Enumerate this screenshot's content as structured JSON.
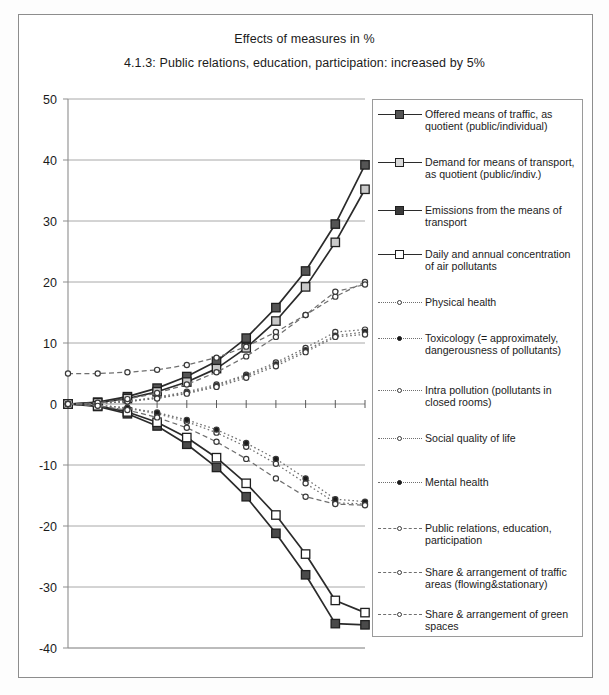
{
  "figure": {
    "title": "Effects of measures in %",
    "subtitle": "4.1.3: Public relations, education, participation: increased by 5%"
  },
  "chart_data": {
    "type": "line",
    "title": "Effects of measures in %",
    "subtitle": "4.1.3: Public relations, education, participation: increased by 5%",
    "xlabel": "",
    "ylabel": "",
    "ylim": [
      -40,
      50
    ],
    "ytick_labels": [
      "50",
      "40",
      "30",
      "20",
      "10",
      "0",
      "-10",
      "-20",
      "-30",
      "-40"
    ],
    "yticks": [
      50,
      40,
      30,
      20,
      10,
      0,
      -10,
      -20,
      -30,
      -40
    ],
    "grid": true,
    "legend_position": "right",
    "x": [
      0,
      1,
      2,
      3,
      4,
      5,
      6,
      7,
      8,
      9,
      10
    ],
    "xtick_labels": [
      "",
      "",
      "",
      "",
      "",
      "",
      "",
      "",
      "",
      "",
      ""
    ],
    "series": [
      {
        "name": "Offered means of traffic, as quotient (public/individual)",
        "style": "solid",
        "marker": "square-filled",
        "values": [
          0,
          0.3,
          1.2,
          2.6,
          4.5,
          7.0,
          10.8,
          15.8,
          21.8,
          29.5,
          39.2
        ]
      },
      {
        "name": "Demand for means of transport, as quotient (public/indiv.)",
        "style": "solid",
        "marker": "square-open",
        "values": [
          0,
          0.2,
          0.9,
          2.0,
          3.6,
          5.8,
          9.2,
          13.6,
          19.2,
          26.5,
          35.2
        ]
      },
      {
        "name": "Emissions from the means of transport",
        "style": "solid",
        "marker": "square-dark",
        "values": [
          0,
          -0.4,
          -1.6,
          -3.6,
          -6.6,
          -10.4,
          -15.2,
          -21.2,
          -28.0,
          -36.0,
          -36.2
        ]
      },
      {
        "name": "Daily and annual concentration of air pollutants",
        "style": "solid",
        "marker": "square-white",
        "values": [
          0,
          -0.3,
          -1.3,
          -3.0,
          -5.5,
          -8.8,
          -13.0,
          -18.2,
          -24.6,
          -32.2,
          -34.2
        ]
      },
      {
        "name": "Physical health",
        "style": "dotted",
        "marker": "circle-open",
        "values": [
          0,
          0.1,
          0.5,
          1.1,
          2.0,
          3.2,
          4.8,
          6.8,
          9.2,
          11.8,
          12.2
        ]
      },
      {
        "name": "Toxicology (= approximately, dangerousness of pollutants)",
        "style": "dotted",
        "marker": "circle-filled",
        "values": [
          0,
          0.1,
          0.4,
          1.0,
          1.8,
          3.0,
          4.6,
          6.5,
          8.8,
          11.2,
          11.8
        ]
      },
      {
        "name": "Intra pollution (pollutants in closed rooms)",
        "style": "dotted",
        "marker": "circle-open",
        "values": [
          0,
          0.1,
          0.4,
          0.9,
          1.7,
          2.8,
          4.3,
          6.2,
          8.5,
          11.0,
          11.4
        ]
      },
      {
        "name": "Social quality of life",
        "style": "dotted",
        "marker": "circle-open",
        "values": [
          0,
          -0.2,
          -0.7,
          -1.6,
          -2.9,
          -4.7,
          -7.0,
          -9.8,
          -13.0,
          -16.2,
          -16.4
        ]
      },
      {
        "name": "Mental health",
        "style": "dotted",
        "marker": "circle-filled",
        "values": [
          0,
          -0.2,
          -0.6,
          -1.4,
          -2.6,
          -4.2,
          -6.4,
          -9.0,
          -12.2,
          -15.6,
          -16.0
        ]
      },
      {
        "name": "Public relations, education, participation",
        "style": "dashed",
        "marker": "circle-open",
        "values": [
          5.0,
          5.0,
          5.2,
          5.6,
          6.4,
          7.6,
          9.4,
          11.8,
          14.6,
          17.6,
          20.0
        ]
      },
      {
        "name": "Share & arrangement of traffic areas (flowing&stationary)",
        "style": "dashed",
        "marker": "circle-open",
        "values": [
          0,
          0.2,
          0.8,
          1.8,
          3.2,
          5.2,
          7.8,
          11.0,
          14.6,
          18.4,
          19.6
        ]
      },
      {
        "name": "Share & arrangement of green spaces",
        "style": "dashed",
        "marker": "circle-open",
        "values": [
          0,
          -0.3,
          -1.0,
          -2.2,
          -3.9,
          -6.2,
          -9.0,
          -12.2,
          -15.2,
          -16.4,
          -16.6
        ]
      }
    ]
  },
  "legend": {
    "items": [
      {
        "label": "Offered means of traffic, as quotient (public/individual)",
        "line": "solid",
        "marker": "sq-filled"
      },
      {
        "label": "Demand for means of transport, as quotient (public/indiv.)",
        "line": "solid",
        "marker": "sq-open"
      },
      {
        "label": "Emissions from the means of transport",
        "line": "solid",
        "marker": "sq-dark"
      },
      {
        "label": "Daily and annual concentration of air pollutants",
        "line": "solid",
        "marker": "sq-white"
      },
      {
        "label": "Physical health",
        "line": "dotted",
        "marker": "dot-open"
      },
      {
        "label": "Toxicology (= approximately, dangerousness of pollutants)",
        "line": "dotted",
        "marker": "dot-filled"
      },
      {
        "label": "Intra pollution (pollutants in closed rooms)",
        "line": "dotted",
        "marker": "dot-open"
      },
      {
        "label": "Social quality of life",
        "line": "dotted",
        "marker": "dot-open"
      },
      {
        "label": "Mental health",
        "line": "dotted",
        "marker": "dot-filled"
      },
      {
        "label": "Public relations, education, participation",
        "line": "dashed",
        "marker": "dot-open"
      },
      {
        "label": "Share & arrangement of traffic areas (flowing&stationary)",
        "line": "dashed",
        "marker": "dot-open"
      },
      {
        "label": "Share & arrangement of green spaces",
        "line": "dashed",
        "marker": "dot-open"
      }
    ]
  },
  "colors": {
    "axis": "#8d8d8d",
    "grid": "#9e9e9e",
    "line_dark": "#2b2b2b",
    "line_mid": "#6f6f6f",
    "marker_fill": "#555555",
    "marker_open": "#d9d9d9",
    "text": "#1b1b1b",
    "background": "#ffffff"
  }
}
